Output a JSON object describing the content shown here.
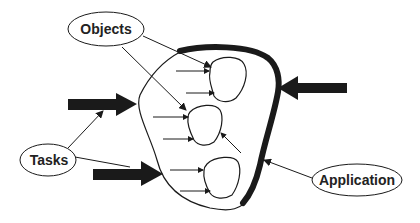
{
  "diagram": {
    "labels": {
      "objects": "Objects",
      "tasks": "Tasks",
      "application": "Application"
    },
    "colors": {
      "ink": "#1a1a1a",
      "background": "#ffffff",
      "text": "#222222"
    },
    "elements": {
      "container": "application-boundary",
      "inner_objects_count": 3,
      "thick_arrows_count": 3
    }
  }
}
